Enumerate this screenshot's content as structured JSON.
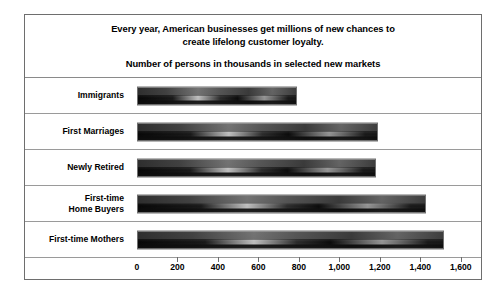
{
  "chart_data": {
    "type": "bar",
    "orientation": "horizontal",
    "title": "Every year, American businesses get millions of new chances to\ncreate lifelong customer loyalty.",
    "subtitle": "Number of persons in thousands in selected new markets",
    "xlabel": "",
    "ylabel": "",
    "xlim": [
      0,
      1700
    ],
    "grid": false,
    "legend": "none",
    "categories": [
      "Immigrants",
      "First Marriages",
      "Newly Retired",
      "First-time\nHome Buyers",
      "First-time Mothers"
    ],
    "values": [
      790,
      1190,
      1180,
      1430,
      1515
    ],
    "tick_values": [
      0,
      200,
      400,
      600,
      800,
      1000,
      1200,
      1400,
      1600
    ],
    "tick_labels": [
      "0",
      "200",
      "400",
      "600",
      "800",
      "1,000",
      "1,200",
      "1,400",
      "1,600"
    ]
  },
  "colors": {
    "frame": "#6e6e6e",
    "separator": "#9a9a9a",
    "bar_dark": "#171717",
    "bar_light": "#8f8f8f",
    "text": "#000000",
    "background": "#ffffff"
  }
}
